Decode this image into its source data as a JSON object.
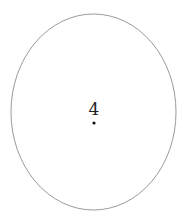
{
  "diagram": {
    "shape": "ellipse",
    "ellipse": {
      "cx": 93.5,
      "cy": 112,
      "rx": 82.5,
      "ry": 98,
      "stroke": "#9a9a9a",
      "fill": "#ffffff"
    },
    "label": {
      "text": "4",
      "x": 94,
      "y": 115,
      "color": "#222222"
    },
    "point": {
      "cx": 94,
      "cy": 123,
      "r": 1.6,
      "color": "#111111"
    }
  }
}
